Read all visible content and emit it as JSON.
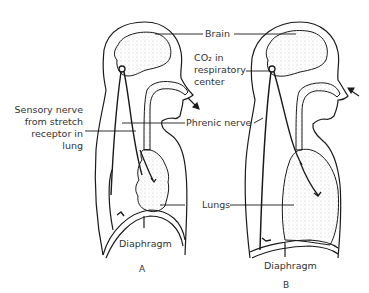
{
  "diagram": {
    "labels": {
      "brain": "Brain",
      "co2_line1": "CO₂ in",
      "co2_line2": "respiratory",
      "co2_line3": "center",
      "sensory_line1": "Sensory nerve",
      "sensory_line2": "from stretch",
      "sensory_line3": "receptor in",
      "sensory_line4": "lung",
      "phrenic": "Phrenic nerve",
      "lungs": "Lungs",
      "diaphragm_a": "Diaphragm",
      "diaphragm_b": "Diaphragm"
    },
    "panels": {
      "a": "A",
      "b": "B"
    },
    "colors": {
      "line": "#1a1a1a",
      "stipple": "#9a9a9a",
      "background": "#ffffff"
    }
  }
}
